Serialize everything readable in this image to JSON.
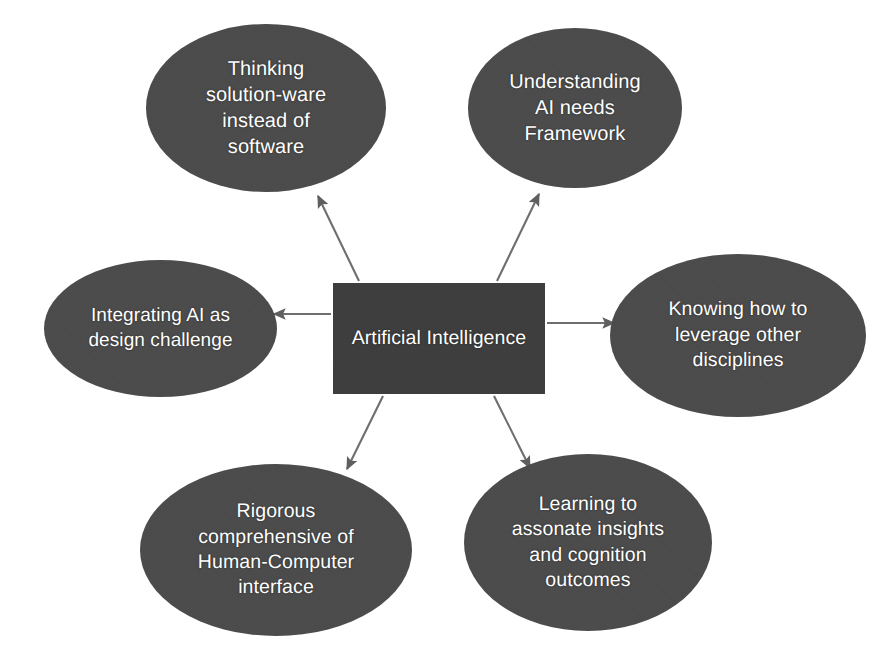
{
  "diagram": {
    "type": "radial-hub-and-spoke",
    "background_color": "#ffffff",
    "center": {
      "id": "center",
      "shape": "rectangle",
      "label": "Artificial Intelligence",
      "fill_color": "#3b3b3b",
      "text_color": "#ffffff"
    },
    "nodes": [
      {
        "id": "top-left",
        "shape": "ellipse",
        "label": "Thinking\nsolution-ware\ninstead of\nsoftware",
        "position": "top-left",
        "fill_color": "#4a4a4a",
        "text_color": "#ffffff"
      },
      {
        "id": "top-right",
        "shape": "ellipse",
        "label": "Understanding\nAI needs\nFramework",
        "position": "top-right",
        "fill_color": "#4a4a4a",
        "text_color": "#ffffff"
      },
      {
        "id": "left",
        "shape": "ellipse",
        "label": "Integrating AI as\ndesign challenge",
        "position": "left",
        "fill_color": "#4a4a4a",
        "text_color": "#ffffff"
      },
      {
        "id": "right",
        "shape": "ellipse",
        "label": "Knowing how to\nleverage other\ndisciplines",
        "position": "right",
        "fill_color": "#4a4a4a",
        "text_color": "#ffffff"
      },
      {
        "id": "bottom-left",
        "shape": "ellipse",
        "label": "Rigorous\ncomprehensive of\nHuman-Computer\ninterface",
        "position": "bottom-left",
        "fill_color": "#4a4a4a",
        "text_color": "#ffffff"
      },
      {
        "id": "bottom-right",
        "shape": "ellipse",
        "label": "Learning to\nassonate insights\nand cognition\noutcomes",
        "position": "bottom-right",
        "fill_color": "#4a4a4a",
        "text_color": "#ffffff"
      }
    ],
    "connectors": {
      "style": "single-headed arrow",
      "direction": "from center outward to each ellipse",
      "line_color": "#6e6e6e",
      "count": 6
    }
  }
}
